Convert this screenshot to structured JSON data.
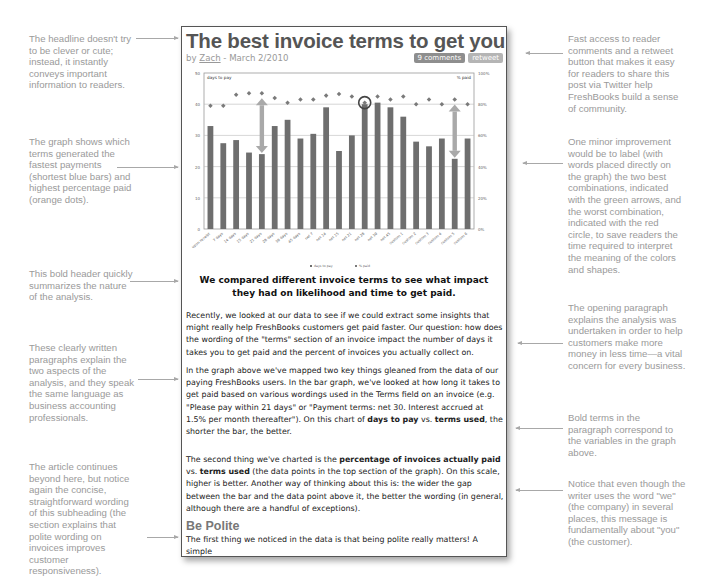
{
  "article": {
    "headline": "The best invoice terms to get you paid faster",
    "byline_prefix": "by ",
    "author": "Zach",
    "date_sep": " - ",
    "date": "March 2/2010",
    "comments_label": "9 comments",
    "retweet_label": "retweet",
    "caption_heading": "We compared different invoice terms to see what impact they had on likelihood and time to get paid.",
    "paragraph1": "Recently, we looked at our data to see if we could extract some insights that might really help FreshBooks customers get paid faster. Our question: how does the wording of the \"terms\" section of an invoice impact the number of days it takes you to get paid and the percent of invoices you actually collect on.",
    "paragraph2_a": "In the graph above we've mapped two key things gleaned from the data of our paying FreshBooks users. In the bar graph, we've looked at how long it takes to get paid based on various wordings used in the Terms field on an invoice (e.g. \"Please pay within 21 days\" or \"Payment terms: net 30. Interest accrued at 1.5% per month thereafter\"). On this chart of ",
    "paragraph2_b1": "days to pay",
    "paragraph2_mid": " vs. ",
    "paragraph2_b2": "terms used",
    "paragraph2_c": ", the shorter the bar, the better.",
    "paragraph3_a": "The second thing we've charted is the ",
    "paragraph3_b1": "percentage of invoices actually paid",
    "paragraph3_mid": " vs. ",
    "paragraph3_b2": "terms used",
    "paragraph3_c": " (the data points in the top section of the graph). On this scale, higher is better. Another way of thinking about this is: the wider the gap between the bar and the data point above it, the better the wording (in general, although there are a handful of exceptions).",
    "subheading": "Be Polite",
    "paragraph4": "The first thing we noticed in the data is that being polite really matters! A simple"
  },
  "annotations": {
    "left": [
      "The headline doesn't try to be clever or cute; instead, it instantly conveys important information to readers.",
      "The graph shows which terms generated the fastest payments (shortest blue bars) and highest percentage paid (orange dots).",
      "This bold header quickly summarizes the nature of the analysis.",
      "These clearly written paragraphs explain the two aspects of the analysis, and they speak the same language as business accounting professionals.",
      "The article continues beyond here, but notice again the concise, straightforward wording of this subheading (the section explains that polite wording on invoices improves customer responsiveness)."
    ],
    "right": [
      "Fast access to reader comments and a retweet button that makes it easy for readers to share this post via Twitter help FreshBooks build a sense of community.",
      "One minor improvement would be to label (with words placed directly on the graph) the two best combinations, indicated with the green arrows, and the worst combination, indicated with the red circle, to save readers the time required to interpret the meaning of the colors and shapes.",
      "The opening paragraph explains the analysis was undertaken in order to help customers make more money in less time—a vital concern for every business.",
      "Bold terms in the paragraph correspond to the variables in the graph above.",
      "Notice that even though the writer uses the word \"we\" (the company) in several places, this message is fundamentally about \"you\" (the customer)."
    ]
  },
  "colors": {
    "bar": "#6e6e6e",
    "dot": "#7a7a7a",
    "arrow": "#a9a9a9",
    "circle": "#444444",
    "annotation_text": "#9a9a9a"
  },
  "chart_data": {
    "type": "bar",
    "title": "",
    "ylabel": "days to pay",
    "y2label": "% paid",
    "ylim": [
      0,
      50
    ],
    "y2lim": [
      0,
      100
    ],
    "yticks": [
      "0",
      "10",
      "20",
      "30",
      "40",
      "50"
    ],
    "y2ticks": [
      "0%",
      "20%",
      "40%",
      "60%",
      "80%",
      "100%"
    ],
    "grid": true,
    "categories": [
      "upon receipt",
      "7 days",
      "14 days",
      "15 days",
      "21 days",
      "28 days",
      "30 days",
      "45 days",
      "net 7",
      "net 14",
      "net 15",
      "net 21",
      "net 28",
      "net 30",
      "net 45",
      "custom 1",
      "custom 2",
      "custom 3",
      "custom 4",
      "custom 5",
      "custom 6"
    ],
    "series": [
      {
        "name": "days to pay (bars)",
        "type": "bar",
        "values": [
          33,
          27.5,
          28.5,
          24.5,
          24,
          33,
          35,
          29,
          30.5,
          39,
          25,
          30,
          40,
          40.5,
          39,
          36,
          28,
          26.5,
          29,
          22.5,
          29
        ]
      },
      {
        "name": "% paid (dots)",
        "type": "scatter",
        "values": [
          79,
          79,
          86,
          87,
          87,
          84,
          81,
          83,
          83,
          85.5,
          86.5,
          85,
          81,
          85,
          83,
          85,
          80,
          83,
          80,
          83,
          80
        ]
      }
    ],
    "legend": [
      "days to pay",
      "% paid"
    ],
    "legend_position": "bottom",
    "highlights": {
      "best": [
        "21 days",
        "custom 5"
      ],
      "worst": "net 28"
    }
  }
}
